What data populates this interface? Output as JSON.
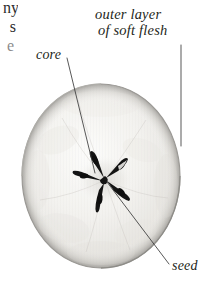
{
  "figure": {
    "background_color": "#ffffff",
    "flesh_color": "#f2f1ee",
    "flesh_shadow_color": "#d8d6d2",
    "outline_color": "#9a9894",
    "core_color": "#1a1a1a",
    "leader_color": "#3a3a3a",
    "text_color": "#231f20"
  },
  "labels": [
    {
      "id": "core",
      "text": "core",
      "x": 36,
      "y": 47
    },
    {
      "id": "outer-layer",
      "line1": "outer layer",
      "line2": "of  soft flesh",
      "x": 95,
      "y": 6
    },
    {
      "id": "seed",
      "text": "seed",
      "x": 172,
      "y": 258
    }
  ],
  "clipped_text_fragments": {
    "line1": "ny",
    "line2": "s",
    "line3": "e"
  },
  "geometry": {
    "apple_center_x": 101,
    "apple_center_y": 176,
    "apple_radius_x": 79,
    "apple_radius_y": 92,
    "core_center_x": 105,
    "core_center_y": 180
  }
}
